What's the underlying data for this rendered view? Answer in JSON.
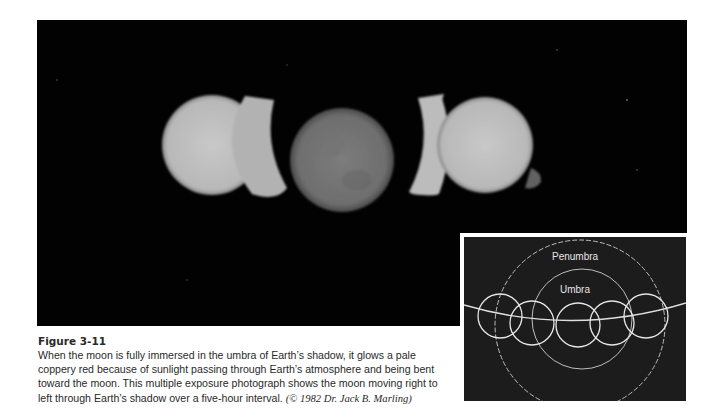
{
  "figure": {
    "label": "Figure 3-11",
    "caption": "When the moon is fully immersed in the umbra of Earth’s shadow, it glows a pale coppery red because of sunlight passing through Earth’s atmosphere and being bent toward the moon. This multiple exposure photograph shows the moon moving right to left through Earth’s shadow over a five-hour interval.",
    "credit": "(© 1982 Dr. Jack B. Marling)"
  },
  "photo": {
    "description": "Multiple exposure photograph of lunar eclipse",
    "moons": [
      {
        "cx": 175,
        "cy": 130,
        "r": 50,
        "color": "#bfbfbf"
      },
      {
        "cx": 305,
        "cy": 145,
        "r": 52,
        "color": "#7a7a7a"
      },
      {
        "cx": 442,
        "cy": 130,
        "r": 50,
        "color": "#c4c4c4"
      }
    ]
  },
  "inset": {
    "penumbra_label": "Penumbra",
    "umbra_label": "Umbra",
    "colors": {
      "background": "#1c1c1c",
      "lines": "#d8d8d8"
    }
  }
}
